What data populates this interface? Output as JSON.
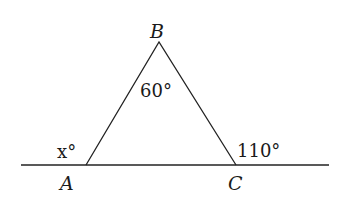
{
  "diagram": {
    "type": "triangle-with-exterior-angles",
    "vertices": {
      "A": {
        "label": "A"
      },
      "B": {
        "label": "B"
      },
      "C": {
        "label": "C"
      }
    },
    "angles": {
      "B_interior": "60°",
      "A_exterior": "x°",
      "C_exterior": "110°"
    }
  }
}
